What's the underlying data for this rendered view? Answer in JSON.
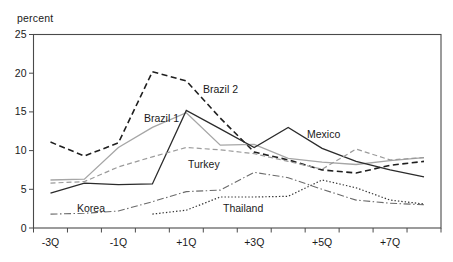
{
  "chart": {
    "y_axis_title": "percent"
  },
  "chart_data": {
    "type": "line",
    "title": "",
    "xlabel": "",
    "ylabel": "percent",
    "ylim": [
      0,
      25
    ],
    "y_ticks": [
      0,
      5,
      10,
      15,
      20,
      25
    ],
    "grid": "off",
    "legend": "inline-labels",
    "x_quarters": [
      -3,
      -2,
      -1,
      0,
      1,
      2,
      3,
      4,
      5,
      6,
      7,
      8
    ],
    "labeled_quarters": [
      -3,
      -1,
      1,
      3,
      5,
      7
    ],
    "x_tick_labels": [
      "-3Q",
      "-1Q",
      "+1Q",
      "+3Q",
      "+5Q",
      "+7Q"
    ],
    "axis_color": "#4a4a4a",
    "text_color": "#1a1a1a",
    "series": [
      {
        "name": "Brazil 2",
        "style": "dashed",
        "color": "#1f1f1f",
        "dash": "6,3.5",
        "width": 1.6,
        "values": [
          11.1,
          9.3,
          11.0,
          20.2,
          19.0,
          14.2,
          9.8,
          8.8,
          7.5,
          7.1,
          8.1,
          8.6
        ],
        "label_pos": {
          "x": 203,
          "y": 93
        }
      },
      {
        "name": "Brazil 1",
        "style": "solid",
        "color": "#a6a6a6",
        "dash": "",
        "width": 1.3,
        "values": [
          6.2,
          6.3,
          10.4,
          13.0,
          14.9,
          10.7,
          10.8,
          9.0,
          8.5,
          8.2,
          8.7,
          9.1
        ],
        "label_pos": {
          "x": 144,
          "y": 122
        }
      },
      {
        "name": "Mexico",
        "style": "solid",
        "color": "#2b2b2b",
        "dash": "",
        "width": 1.3,
        "values": [
          4.5,
          5.8,
          5.6,
          5.7,
          15.2,
          12.8,
          10.4,
          13.0,
          10.3,
          8.6,
          7.5,
          6.6
        ],
        "label_pos": {
          "x": 307,
          "y": 138
        }
      },
      {
        "name": "Turkey",
        "style": "dashed",
        "color": "#9b9b9b",
        "dash": "5,3",
        "width": 1.2,
        "values": [
          5.8,
          6.0,
          7.9,
          9.2,
          10.4,
          10.1,
          9.6,
          8.6,
          7.6,
          10.2,
          8.8,
          9.1
        ],
        "label_pos": {
          "x": 188,
          "y": 168
        }
      },
      {
        "name": "Korea",
        "style": "dash-dot",
        "color": "#6b6b6b",
        "dash": "7,2.5,1.5,2.5",
        "width": 1.1,
        "values": [
          1.8,
          1.9,
          2.2,
          3.4,
          4.7,
          4.9,
          7.2,
          6.5,
          5.0,
          3.6,
          3.2,
          3.0
        ],
        "label_pos": {
          "x": 77,
          "y": 212
        }
      },
      {
        "name": "Thailand",
        "style": "dotted",
        "color": "#333333",
        "dash": "1.4,2",
        "width": 1.2,
        "values": [
          null,
          null,
          null,
          1.8,
          2.3,
          4.0,
          4.0,
          4.1,
          6.2,
          5.2,
          3.6,
          3.1
        ],
        "label_pos": {
          "x": 223,
          "y": 212
        }
      }
    ]
  }
}
